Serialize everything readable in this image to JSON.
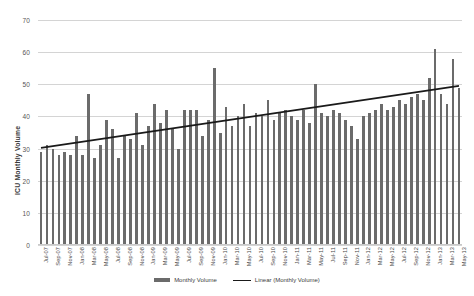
{
  "chart_data": {
    "type": "bar",
    "title": "",
    "xlabel": "",
    "ylabel": "ICU Monthly Volume",
    "ylim": [
      0,
      70
    ],
    "yticks": [
      0,
      10,
      20,
      30,
      40,
      50,
      60,
      70
    ],
    "grid": true,
    "legend_position": "bottom",
    "categories": [
      "Jul-07",
      "Aug-07",
      "Sep-07",
      "Oct-07",
      "Nov-07",
      "Dec-07",
      "Jan-08",
      "Feb-08",
      "Mar-08",
      "Apr-08",
      "May-08",
      "Jun-08",
      "Jul-08",
      "Aug-08",
      "Sep-08",
      "Oct-08",
      "Nov-08",
      "Dec-08",
      "Jan-09",
      "Feb-09",
      "Mar-09",
      "Apr-09",
      "May-09",
      "Jun-09",
      "Jul-09",
      "Aug-09",
      "Sep-09",
      "Oct-09",
      "Nov-09",
      "Dec-09",
      "Jan-10",
      "Feb-10",
      "Mar-10",
      "Apr-10",
      "May-10",
      "Jun-10",
      "Jul-10",
      "Aug-10",
      "Sep-10",
      "Oct-10",
      "Nov-10",
      "Dec-10",
      "Jan-11",
      "Feb-11",
      "Mar-11",
      "Apr-11",
      "May-11",
      "Jun-11",
      "Jul-11",
      "Aug-11",
      "Sep-11",
      "Oct-11",
      "Nov-11",
      "Dec-11",
      "Jan-12",
      "Feb-12",
      "Mar-12",
      "Apr-12",
      "May-12",
      "Jun-12",
      "Jul-12",
      "Aug-12",
      "Sep-12",
      "Oct-12",
      "Nov-12",
      "Dec-12",
      "Jan-13",
      "Feb-13",
      "Mar-13",
      "Apr-13",
      "May-13"
    ],
    "tick_labels": [
      "Jul-07",
      "Sep-07",
      "Nov-07",
      "Jan-08",
      "Mar-08",
      "May-08",
      "Jul-08",
      "Sep-08",
      "Nov-08",
      "Jan-09",
      "Mar-09",
      "May-09",
      "Jul-09",
      "Sep-09",
      "Nov-09",
      "Jan-10",
      "Mar-10",
      "May-10",
      "Jul-10",
      "Sep-10",
      "Nov-10",
      "Jan-11",
      "Mar-11",
      "May-11",
      "Jul-11",
      "Sep-11",
      "Nov-11",
      "Jan-12",
      "Mar-12",
      "May-12",
      "Jul-12",
      "Sep-12",
      "Nov-12",
      "Jan-13",
      "Mar-13",
      "May-13"
    ],
    "series": [
      {
        "name": "Monthly Volume",
        "type": "bar",
        "color": "#6b6b6b",
        "values": [
          29,
          31,
          30,
          28,
          29,
          28,
          34,
          28,
          47,
          27,
          31,
          39,
          36,
          27,
          34,
          33,
          41,
          31,
          37,
          44,
          38,
          42,
          36,
          30,
          42,
          42,
          42,
          34,
          39,
          55,
          35,
          43,
          37,
          40,
          44,
          37,
          41,
          40,
          45,
          39,
          41,
          42,
          40,
          39,
          42,
          38,
          50,
          41,
          40,
          42,
          41,
          39,
          37,
          33,
          40,
          41,
          42,
          44,
          42,
          43,
          45,
          44,
          46,
          47,
          45,
          52,
          61,
          47,
          44,
          58,
          49
        ]
      },
      {
        "name": "Linear (Monthly Volume)",
        "type": "line",
        "color": "#1a1a1a",
        "trendline": true,
        "start_value": 30.2,
        "end_value": 49.5
      }
    ],
    "legend": [
      {
        "label": "Monthly Volume",
        "marker": "bar",
        "color": "#6b6b6b"
      },
      {
        "label": "Linear (Monthly Volume)",
        "marker": "line",
        "color": "#1a1a1a"
      }
    ]
  }
}
